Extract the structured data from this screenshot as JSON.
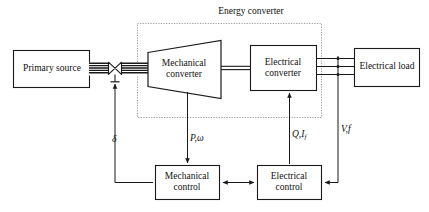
{
  "figure": {
    "kind": "block-diagram",
    "stroke_color": "#1a1a1a",
    "dotted_color": "#8a8a8a",
    "background": "#ffffff"
  },
  "group": {
    "energy_converter_label": "Energy converter"
  },
  "blocks": {
    "primary_source": {
      "label": "Primary source"
    },
    "mechanical_converter": {
      "label_line1": "Mechanical",
      "label_line2": "converter"
    },
    "electrical_converter": {
      "label_line1": "Electrical",
      "label_line2": "converter"
    },
    "electrical_load": {
      "label": "Electrical load"
    },
    "mechanical_control": {
      "label_line1": "Mechanical",
      "label_line2": "control"
    },
    "electrical_control": {
      "label_line1": "Electrical",
      "label_line2": "control"
    }
  },
  "signals": {
    "delta": "δ",
    "mech_power_speed": "P,ω",
    "reactive_field": "Q,I",
    "reactive_field_sub": "f",
    "voltage_freq": "V,f"
  },
  "connections": [
    {
      "from": "primary-source",
      "to": "mechanical-converter",
      "type": "shaft-with-valve"
    },
    {
      "from": "mechanical-converter",
      "to": "electrical-converter",
      "type": "shaft"
    },
    {
      "from": "electrical-converter",
      "to": "electrical-load",
      "type": "three-phase-line"
    },
    {
      "from": "mechanical-converter",
      "to": "mechanical-control",
      "type": "signal",
      "label": "P,ω"
    },
    {
      "from": "electrical-control",
      "to": "electrical-converter",
      "type": "signal",
      "label": "Q,I_f"
    },
    {
      "from": "three-phase-tap",
      "to": "electrical-control",
      "type": "signal",
      "label": "V,f"
    },
    {
      "from": "mechanical-control",
      "to": "valve",
      "type": "signal",
      "label": "δ"
    },
    {
      "from": "mechanical-control",
      "to": "electrical-control",
      "type": "bidirectional"
    }
  ]
}
